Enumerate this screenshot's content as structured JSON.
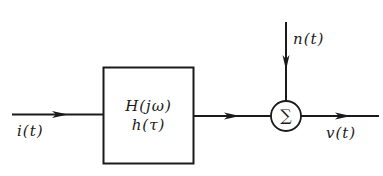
{
  "diagram": {
    "type": "block-diagram",
    "input": {
      "label": "i(t)"
    },
    "block": {
      "line1": "H(jω)",
      "line2": "h(τ)"
    },
    "noise": {
      "label": "n(t)"
    },
    "summer": {
      "symbol": "∑"
    },
    "output": {
      "label": "v(t)"
    },
    "colors": {
      "stroke": "#1a1a1a",
      "background": "#ffffff"
    },
    "edges": [
      {
        "from": "input",
        "to": "block"
      },
      {
        "from": "block",
        "to": "summer"
      },
      {
        "from": "noise",
        "to": "summer"
      },
      {
        "from": "summer",
        "to": "output"
      }
    ]
  }
}
